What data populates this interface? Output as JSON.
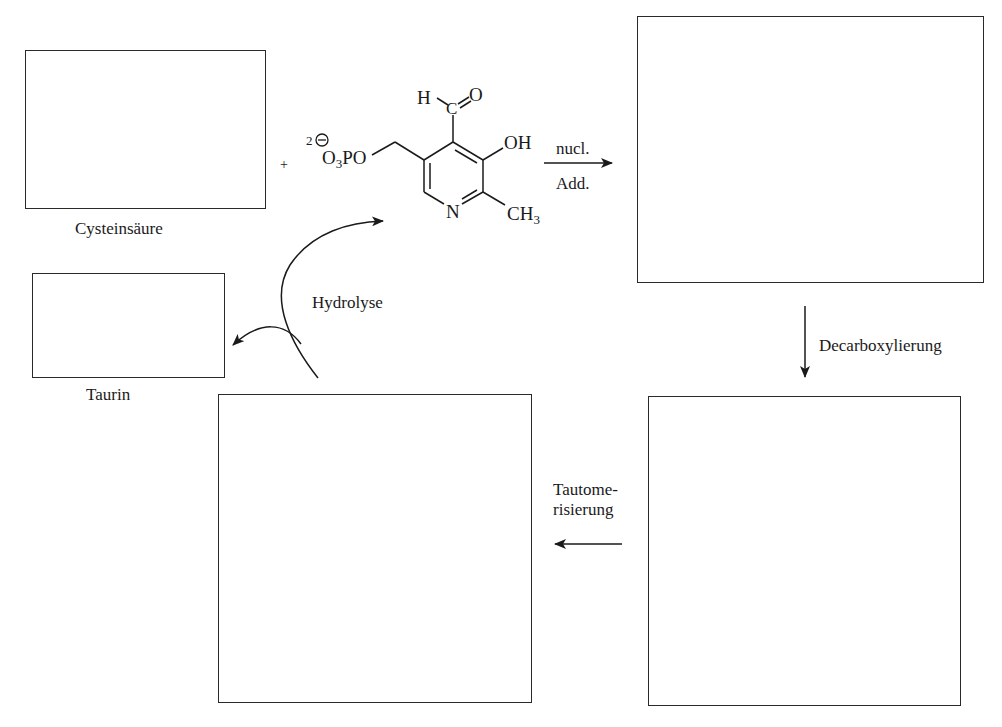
{
  "diagram": {
    "boxes": {
      "cysteinsaeure": {
        "label": "Cysteinsäure",
        "content": ""
      },
      "taurin": {
        "label": "Taurin",
        "content": ""
      },
      "intermediate_1": {
        "label": "",
        "content": ""
      },
      "intermediate_2": {
        "label": "",
        "content": ""
      },
      "intermediate_3": {
        "label": "",
        "content": ""
      }
    },
    "plus_sign": "+",
    "reagent": {
      "name": "Pyridoxalphosphat",
      "phosphate_charge": "2⊖",
      "phosphate_group": "O3PO",
      "aldehyde_h": "H",
      "aldehyde_c": "C",
      "aldehyde_o": "O",
      "hydroxyl": "OH",
      "ring_nitrogen": "N",
      "methyl": "CH3"
    },
    "steps": [
      {
        "id": "nucl_add",
        "label_top": "nucl.",
        "label_bottom": "Add.",
        "direction": "right"
      },
      {
        "id": "decarboxylierung",
        "label": "Decarboxylierung",
        "direction": "down"
      },
      {
        "id": "tautomerisierung",
        "label_line1": "Tautome-",
        "label_line2": "risierung",
        "direction": "left"
      },
      {
        "id": "hydrolyse",
        "label": "Hydrolyse",
        "direction": "curved"
      }
    ]
  }
}
